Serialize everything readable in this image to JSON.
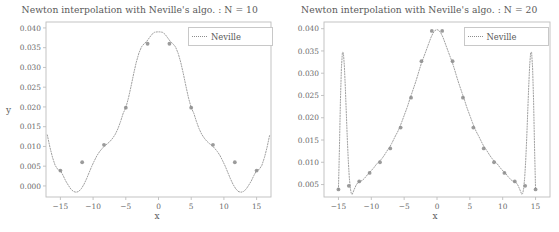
{
  "figure": {
    "width": 559,
    "height": 232,
    "background": "#ffffff",
    "line_color": "#9a9a9a",
    "marker_color": "#8a8a8a",
    "text_color": "#5a5a5a",
    "frame_color": "#bdbdbd"
  },
  "chart_data": [
    {
      "type": "line",
      "title": "Newton interpolation with Neville's algo. : N = 10",
      "xlabel": "x",
      "ylabel": "y",
      "grid": false,
      "legend_position": "upper right",
      "legend_entries": [
        "Neville"
      ],
      "linestyle": "dotted",
      "xlim": [
        -17.2,
        17.2
      ],
      "ylim": [
        -0.0028,
        0.0415
      ],
      "xticks": [
        -15,
        -10,
        -5,
        0,
        5,
        10,
        15
      ],
      "xticklabels": [
        "−15",
        "−10",
        "−5",
        "0",
        "5",
        "10",
        "15"
      ],
      "yticks": [
        0.0,
        0.005,
        0.01,
        0.015,
        0.02,
        0.025,
        0.03,
        0.035,
        0.04
      ],
      "yticklabels": [
        "0.000",
        "0.005",
        "0.010",
        "0.015",
        "0.020",
        "0.025",
        "0.030",
        "0.035",
        "0.040"
      ],
      "nodes_x": [
        -15.0,
        -11.67,
        -8.33,
        -5.0,
        -1.67,
        1.67,
        5.0,
        8.33,
        11.67,
        15.0
      ],
      "nodes_y": [
        0.0039,
        0.006,
        0.0104,
        0.0198,
        0.036,
        0.036,
        0.0198,
        0.0104,
        0.006,
        0.0039
      ],
      "curve_x": [
        -17.0,
        -16.6,
        -16.2,
        -15.8,
        -15.4,
        -15.0,
        -14.6,
        -14.2,
        -13.8,
        -13.4,
        -13.0,
        -12.6,
        -12.2,
        -11.8,
        -11.4,
        -11.0,
        -10.6,
        -10.2,
        -9.8,
        -9.4,
        -9.0,
        -8.6,
        -8.2,
        -7.8,
        -7.4,
        -7.0,
        -6.6,
        -6.2,
        -5.8,
        -5.4,
        -5.0,
        -4.6,
        -4.2,
        -3.8,
        -3.4,
        -3.0,
        -2.6,
        -2.2,
        -1.8,
        -1.4,
        -1.0,
        -0.6,
        -0.2,
        0.2,
        0.6,
        1.0,
        1.4,
        1.8,
        2.2,
        2.6,
        3.0,
        3.4,
        3.8,
        4.2,
        4.6,
        5.0,
        5.4,
        5.8,
        6.2,
        6.6,
        7.0,
        7.4,
        7.8,
        8.2,
        8.6,
        9.0,
        9.4,
        9.8,
        10.2,
        10.6,
        11.0,
        11.4,
        11.8,
        12.2,
        12.6,
        13.0,
        13.4,
        13.8,
        14.2,
        14.6,
        15.0,
        15.4,
        15.8,
        16.2,
        16.6,
        17.0
      ],
      "curve_y": [
        0.0129,
        0.0098,
        0.0072,
        0.0052,
        0.0042,
        0.0039,
        0.0027,
        0.0013,
        0.0002,
        -0.0008,
        -0.0014,
        -0.0016,
        -0.0014,
        -0.0007,
        0.0004,
        0.0018,
        0.0034,
        0.005,
        0.0064,
        0.0077,
        0.0087,
        0.0095,
        0.0102,
        0.0107,
        0.0113,
        0.0121,
        0.0131,
        0.0145,
        0.0163,
        0.0184,
        0.0198,
        0.0222,
        0.0252,
        0.0284,
        0.0313,
        0.0336,
        0.0352,
        0.036,
        0.0366,
        0.0375,
        0.0384,
        0.0389,
        0.039,
        0.039,
        0.0389,
        0.0384,
        0.0375,
        0.0366,
        0.036,
        0.0352,
        0.0336,
        0.0313,
        0.0284,
        0.0252,
        0.0222,
        0.0198,
        0.0184,
        0.0163,
        0.0145,
        0.0131,
        0.0121,
        0.0113,
        0.0107,
        0.0102,
        0.0095,
        0.0087,
        0.0077,
        0.0064,
        0.005,
        0.0034,
        0.0018,
        0.0004,
        -0.0007,
        -0.0014,
        -0.0016,
        -0.0014,
        -0.0008,
        0.0002,
        0.0013,
        0.0027,
        0.0039,
        0.0042,
        0.0052,
        0.0072,
        0.0098,
        0.0129
      ]
    },
    {
      "type": "line",
      "title": "Newton interpolation with Neville's algo. : N = 20",
      "xlabel": "x",
      "ylabel": "",
      "grid": false,
      "legend_position": "upper right",
      "legend_entries": [
        "Neville"
      ],
      "linestyle": "dotted",
      "xlim": [
        -17.2,
        17.2
      ],
      "ylim": [
        0.0022,
        0.0415
      ],
      "xticks": [
        -15,
        -10,
        -5,
        0,
        5,
        10,
        15
      ],
      "xticklabels": [
        "−15",
        "−10",
        "−5",
        "0",
        "5",
        "10",
        "15"
      ],
      "yticks": [
        0.005,
        0.01,
        0.015,
        0.02,
        0.025,
        0.03,
        0.035,
        0.04
      ],
      "yticklabels": [
        "0.005",
        "0.010",
        "0.015",
        "0.020",
        "0.025",
        "0.030",
        "0.035",
        "0.040"
      ],
      "nodes_x": [
        -15.0,
        -13.42,
        -11.84,
        -10.26,
        -8.68,
        -7.11,
        -5.53,
        -3.95,
        -2.37,
        -0.79,
        0.79,
        2.37,
        3.95,
        5.53,
        7.11,
        8.68,
        10.26,
        11.84,
        13.42,
        15.0
      ],
      "nodes_y": [
        0.0039,
        0.0047,
        0.0057,
        0.0076,
        0.01,
        0.0131,
        0.0178,
        0.0245,
        0.0327,
        0.0395,
        0.0395,
        0.0327,
        0.0245,
        0.0178,
        0.0131,
        0.01,
        0.0076,
        0.0057,
        0.0047,
        0.0039
      ],
      "curve_x": [
        -15.0,
        -14.85,
        -14.7,
        -14.55,
        -14.4,
        -14.25,
        -14.1,
        -13.95,
        -13.8,
        -13.65,
        -13.5,
        -13.35,
        -13.2,
        -13.05,
        -12.9,
        -12.6,
        -12.3,
        -12.0,
        -11.7,
        -11.4,
        -11.1,
        -10.8,
        -10.5,
        -10.2,
        -9.9,
        -9.6,
        -9.3,
        -9.0,
        -8.7,
        -8.4,
        -8.1,
        -7.8,
        -7.5,
        -7.2,
        -6.9,
        -6.6,
        -6.3,
        -6.0,
        -5.7,
        -5.4,
        -5.1,
        -4.8,
        -4.5,
        -4.2,
        -3.9,
        -3.6,
        -3.3,
        -3.0,
        -2.7,
        -2.4,
        -2.1,
        -1.8,
        -1.5,
        -1.2,
        -0.9,
        -0.6,
        -0.3,
        0.0,
        0.3,
        0.6,
        0.9,
        1.2,
        1.5,
        1.8,
        2.1,
        2.4,
        2.7,
        3.0,
        3.3,
        3.6,
        3.9,
        4.2,
        4.5,
        4.8,
        5.1,
        5.4,
        5.7,
        6.0,
        6.3,
        6.6,
        6.9,
        7.2,
        7.5,
        7.8,
        8.1,
        8.4,
        8.7,
        9.0,
        9.3,
        9.6,
        9.9,
        10.2,
        10.5,
        10.8,
        11.1,
        11.4,
        11.7,
        12.0,
        12.3,
        12.6,
        12.9,
        13.05,
        13.2,
        13.35,
        13.5,
        13.65,
        13.8,
        13.95,
        14.1,
        14.25,
        14.4,
        14.55,
        14.7,
        14.85,
        15.0
      ],
      "curve_y": [
        0.0039,
        0.0132,
        0.0238,
        0.0312,
        0.0347,
        0.0346,
        0.0316,
        0.0267,
        0.0209,
        0.0152,
        0.0103,
        0.0066,
        0.0042,
        0.003,
        0.0028,
        0.0039,
        0.0049,
        0.0055,
        0.0057,
        0.0059,
        0.0063,
        0.0068,
        0.0074,
        0.0078,
        0.0083,
        0.0088,
        0.0094,
        0.0099,
        0.0103,
        0.0108,
        0.0114,
        0.0121,
        0.0128,
        0.0134,
        0.0142,
        0.0151,
        0.016,
        0.0168,
        0.0178,
        0.0189,
        0.0201,
        0.0213,
        0.0225,
        0.0239,
        0.0252,
        0.0265,
        0.0278,
        0.0292,
        0.0307,
        0.0321,
        0.0333,
        0.0345,
        0.0357,
        0.0369,
        0.0381,
        0.039,
        0.0396,
        0.0398,
        0.0396,
        0.039,
        0.0381,
        0.0369,
        0.0357,
        0.0345,
        0.0333,
        0.0321,
        0.0307,
        0.0292,
        0.0278,
        0.0265,
        0.0252,
        0.0239,
        0.0225,
        0.0213,
        0.0201,
        0.0189,
        0.0178,
        0.0168,
        0.016,
        0.0151,
        0.0142,
        0.0134,
        0.0128,
        0.0121,
        0.0114,
        0.0108,
        0.0103,
        0.0099,
        0.0094,
        0.0088,
        0.0083,
        0.0078,
        0.0074,
        0.0068,
        0.0063,
        0.0059,
        0.0057,
        0.0055,
        0.0049,
        0.0039,
        0.0028,
        0.003,
        0.0042,
        0.0066,
        0.0103,
        0.0152,
        0.0209,
        0.0267,
        0.0316,
        0.0346,
        0.0347,
        0.0312,
        0.0238,
        0.0132,
        0.0039
      ]
    }
  ],
  "panels": [
    {
      "plot_box": {
        "left": 46,
        "top": 22,
        "right": 271,
        "bottom": 197
      },
      "legend": {
        "left": 188,
        "top": 27,
        "width": 76,
        "height": 15
      }
    },
    {
      "plot_box": {
        "left": 44,
        "top": 22,
        "right": 270,
        "bottom": 197
      },
      "legend": {
        "left": 184,
        "top": 27,
        "width": 76,
        "height": 15
      }
    }
  ]
}
